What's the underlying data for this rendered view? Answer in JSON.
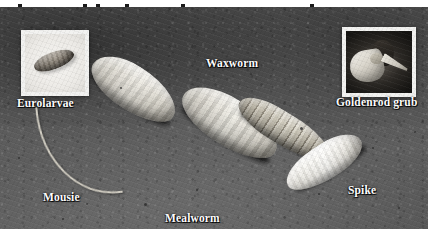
{
  "figure": {
    "kind": "photograph",
    "background_color": "#575757",
    "label_color": "#ffffff"
  },
  "top_strip": {
    "description": "thin white strip at the very top of the image with the cropped descenders of a caption line above",
    "background_color": "#ffffff",
    "fragment_color": "#1b1b1b",
    "fragments": [
      {
        "left": 18
      },
      {
        "left": 83
      },
      {
        "left": 96
      },
      {
        "left": 125
      },
      {
        "left": 181
      },
      {
        "left": 310
      }
    ]
  },
  "insets": [
    {
      "id": "eurolarvae",
      "label": "Eurolarvae",
      "frame_color": "#f2f2f0",
      "photo_background": "#eceae6"
    },
    {
      "id": "goldenrod-grub",
      "label": "Goldenrod grub",
      "frame_color": "#f2f2f0",
      "photo_background": "#141311"
    }
  ],
  "specimens": [
    {
      "id": "mousie",
      "label": "Mousie",
      "note": "pale maggot with a long slender breathing tail"
    },
    {
      "id": "waxworm",
      "label": "Waxworm",
      "note": "plump cream-coloured grub"
    },
    {
      "id": "mealworm",
      "label": "Mealworm",
      "note": "tan, strongly segmented beetle larva"
    },
    {
      "id": "spike",
      "label": "Spike",
      "note": "bright white maggot"
    }
  ],
  "labels": {
    "eurolarvae": "Eurolarvae",
    "mousie": "Mousie",
    "waxworm": "Waxworm",
    "mealworm": "Mealworm",
    "goldenrod_grub": "Goldenrod grub",
    "spike": "Spike"
  },
  "specks": [
    {
      "left": 18,
      "top": 150,
      "size": 2
    },
    {
      "left": 62,
      "top": 211,
      "size": 2
    },
    {
      "left": 120,
      "top": 80,
      "size": 2
    },
    {
      "left": 144,
      "top": 196,
      "size": 3
    },
    {
      "left": 196,
      "top": 182,
      "size": 2
    },
    {
      "left": 250,
      "top": 66,
      "size": 2
    },
    {
      "left": 300,
      "top": 120,
      "size": 3
    },
    {
      "left": 318,
      "top": 186,
      "size": 2
    },
    {
      "left": 372,
      "top": 140,
      "size": 2
    },
    {
      "left": 398,
      "top": 200,
      "size": 2
    },
    {
      "left": 414,
      "top": 124,
      "size": 2
    },
    {
      "left": 86,
      "top": 196,
      "size": 2
    }
  ]
}
